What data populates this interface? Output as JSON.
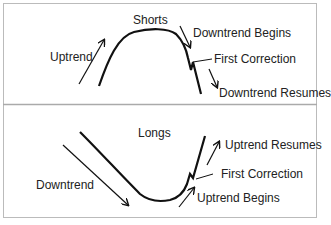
{
  "colors": {
    "ink": "#111111",
    "frame": "#bbbbbb",
    "background": "#ffffff",
    "text": "#222222"
  },
  "panels": [
    {
      "id": "shorts",
      "title": "Shorts",
      "labels": {
        "trend_in": "Uptrend",
        "begins": "Downtrend Begins",
        "correction": "First Correction",
        "resumes": "Downtrend Resumes"
      }
    },
    {
      "id": "longs",
      "title": "Longs",
      "labels": {
        "trend_in": "Downtrend",
        "begins": "Uptrend Begins",
        "correction": "First Correction",
        "resumes": "Uptrend Resumes"
      }
    }
  ]
}
